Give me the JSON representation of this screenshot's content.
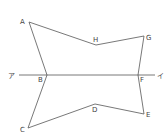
{
  "diagram": {
    "type": "geometry-figure",
    "stroke_color": "#555555",
    "label_color": "#444444",
    "points": [
      {
        "id": "A",
        "label": "A",
        "x": 29,
        "y": 22,
        "lx": 20,
        "ly": 24
      },
      {
        "id": "H",
        "label": "H",
        "x": 96,
        "y": 45,
        "lx": 93,
        "ly": 42
      },
      {
        "id": "G",
        "label": "G",
        "x": 144,
        "y": 36,
        "lx": 146,
        "ly": 40
      },
      {
        "id": "B",
        "label": "B",
        "x": 47,
        "y": 75,
        "lx": 38,
        "ly": 82
      },
      {
        "id": "F",
        "label": "F",
        "x": 138,
        "y": 75,
        "lx": 140,
        "ly": 82
      },
      {
        "id": "C",
        "label": "C",
        "x": 28,
        "y": 128,
        "lx": 20,
        "ly": 132
      },
      {
        "id": "D",
        "label": "D",
        "x": 95,
        "y": 104,
        "lx": 92,
        "ly": 112
      },
      {
        "id": "E",
        "label": "E",
        "x": 144,
        "y": 114,
        "lx": 146,
        "ly": 117
      }
    ],
    "line": {
      "x1": 19,
      "y1": 75,
      "x2": 155,
      "y2": 75,
      "left_label": "ア",
      "right_label": "イ",
      "left_lx": 8,
      "left_ly": 78,
      "right_lx": 157,
      "right_ly": 78
    },
    "polygon_order": [
      "A",
      "H",
      "G",
      "F",
      "E",
      "D",
      "C",
      "B"
    ]
  }
}
